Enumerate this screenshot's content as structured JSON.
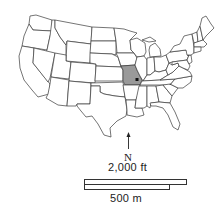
{
  "map": {
    "region": "Contiguous United States",
    "highlighted_state": "Missouri",
    "highlight_color": "#9a9a9a",
    "outline_color": "#3a3a3a",
    "marker": {
      "type": "point",
      "location": "St. Louis area, eastern Missouri"
    }
  },
  "north_arrow": {
    "label": "N"
  },
  "scale_bar": {
    "upper_label": "2,000 ft",
    "lower_label": "500 m"
  }
}
